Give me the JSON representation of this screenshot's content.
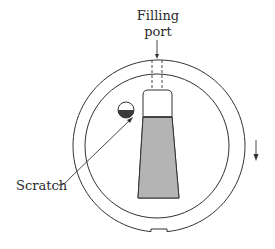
{
  "diagram": {
    "labels": {
      "filling_line1": "Filling",
      "filling_line2": "port",
      "scratch": "Scratch"
    },
    "colors": {
      "stroke": "#333333",
      "liquid_fill": "#b4b4b4",
      "bubble_fill": "#3a3a3a",
      "background": "#ffffff"
    },
    "elements": [
      "outer-ring",
      "inner-ring",
      "filling-port",
      "container",
      "liquid",
      "scratch-bubble",
      "scratch-leader",
      "rotation-arrow",
      "notch"
    ]
  }
}
